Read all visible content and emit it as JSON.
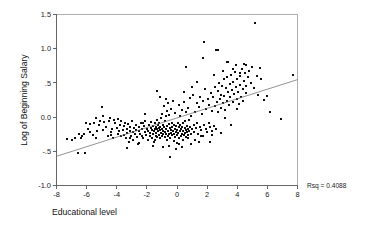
{
  "chart_data": {
    "type": "scatter",
    "title": "",
    "xlabel": "Educational level",
    "ylabel": "Log of Beginning Salary",
    "xlim": [
      -8,
      8
    ],
    "ylim": [
      -1.0,
      1.5
    ],
    "grid": false,
    "legend": null,
    "xticks": [
      -8,
      -6,
      -4,
      -2,
      0,
      2,
      4,
      6,
      8
    ],
    "xticklabels": [
      "-8",
      "-6",
      "-4",
      "-2",
      "0",
      "2",
      "4",
      "6",
      "8"
    ],
    "yticks": [
      -1.0,
      -0.5,
      0.0,
      0.5,
      1.0,
      1.5
    ],
    "yticklabels": [
      "-1.0",
      "-.5",
      "0.0",
      ".5",
      "1.0",
      "1.5"
    ],
    "annotations": [
      {
        "name": "rsq",
        "text": "Rsq = 0.4088",
        "x": 8.5,
        "y": -1.05
      }
    ],
    "fit_line": {
      "name": "linear-regression-line",
      "x": [
        -8,
        8
      ],
      "y": [
        -0.573,
        0.548
      ],
      "slope": 0.0701,
      "intercept": -0.0125,
      "rsq": 0.4088
    },
    "marker": {
      "shape": "square",
      "size": 2.0,
      "color": "#0d0d0d"
    },
    "points": [
      [
        -7.3,
        -0.32
      ],
      [
        -7.0,
        -0.33
      ],
      [
        -6.8,
        -0.3
      ],
      [
        -6.6,
        -0.52
      ],
      [
        -6.4,
        -0.31
      ],
      [
        -6.3,
        -0.28
      ],
      [
        -6.2,
        -0.25
      ],
      [
        -6.1,
        -0.53
      ],
      [
        -6.05,
        -0.09
      ],
      [
        -5.9,
        -0.17
      ],
      [
        -5.8,
        -0.1
      ],
      [
        -5.6,
        -0.26
      ],
      [
        -5.5,
        -0.08
      ],
      [
        -5.4,
        -0.3
      ],
      [
        -5.3,
        -0.21
      ],
      [
        -5.2,
        -0.11
      ],
      [
        -5.1,
        -0.06
      ],
      [
        -5.0,
        0.15
      ],
      [
        -4.9,
        -0.19
      ],
      [
        -4.85,
        -0.07
      ],
      [
        -4.7,
        -0.14
      ],
      [
        -4.6,
        -0.27
      ],
      [
        -4.5,
        -0.05
      ],
      [
        -4.45,
        -0.02
      ],
      [
        -4.4,
        -0.22
      ],
      [
        -4.3,
        -0.18
      ],
      [
        -4.25,
        -0.3
      ],
      [
        -4.2,
        -0.04
      ],
      [
        -4.1,
        -0.08
      ],
      [
        -4.0,
        -0.16
      ],
      [
        -3.95,
        -0.24
      ],
      [
        -3.9,
        -0.03
      ],
      [
        -3.85,
        -0.21
      ],
      [
        -3.8,
        -0.12
      ],
      [
        -3.75,
        -0.27
      ],
      [
        -3.7,
        -0.05
      ],
      [
        -3.6,
        -0.19
      ],
      [
        -3.55,
        -0.26
      ],
      [
        -3.5,
        -0.13
      ],
      [
        -3.45,
        -0.08
      ],
      [
        -3.4,
        -0.3
      ],
      [
        -3.35,
        -0.17
      ],
      [
        -3.3,
        -0.23
      ],
      [
        -3.25,
        -0.1
      ],
      [
        -3.2,
        -0.36
      ],
      [
        -3.15,
        -0.2
      ],
      [
        -3.1,
        -0.14
      ],
      [
        -3.05,
        -0.28
      ],
      [
        -3.0,
        -0.06
      ],
      [
        -2.95,
        -0.22
      ],
      [
        -2.9,
        -0.33
      ],
      [
        -2.85,
        -0.16
      ],
      [
        -2.8,
        -0.25
      ],
      [
        -2.75,
        -0.11
      ],
      [
        -2.7,
        -0.19
      ],
      [
        -2.65,
        -0.29
      ],
      [
        -2.6,
        -0.4
      ],
      [
        -2.55,
        -0.21
      ],
      [
        -2.5,
        -0.15
      ],
      [
        -2.45,
        -0.24
      ],
      [
        -2.4,
        -0.09
      ],
      [
        -2.35,
        -0.27
      ],
      [
        -2.3,
        -0.18
      ],
      [
        -2.25,
        -0.31
      ],
      [
        -2.2,
        -0.13
      ],
      [
        -2.15,
        -0.22
      ],
      [
        -2.1,
        -0.05
      ],
      [
        -2.05,
        -0.26
      ],
      [
        -2.0,
        -0.17
      ],
      [
        -1.95,
        -0.34
      ],
      [
        -1.9,
        -0.2
      ],
      [
        -1.85,
        -0.11
      ],
      [
        -1.8,
        -0.28
      ],
      [
        -1.78,
        -0.23
      ],
      [
        -1.75,
        -0.16
      ],
      [
        -1.7,
        -0.07
      ],
      [
        -1.68,
        -0.3
      ],
      [
        -1.65,
        -0.19
      ],
      [
        -1.6,
        -0.25
      ],
      [
        -1.58,
        -0.13
      ],
      [
        -1.55,
        -0.36
      ],
      [
        -1.5,
        -0.21
      ],
      [
        -1.48,
        -0.17
      ],
      [
        -1.45,
        -0.09
      ],
      [
        -1.42,
        -0.27
      ],
      [
        -1.4,
        -0.14
      ],
      [
        -1.38,
        -0.23
      ],
      [
        -1.35,
        -0.04
      ],
      [
        -1.32,
        -0.18
      ],
      [
        -1.3,
        -0.29
      ],
      [
        -1.28,
        -0.12
      ],
      [
        -1.25,
        -0.21
      ],
      [
        -1.22,
        -0.16
      ],
      [
        -1.2,
        -0.26
      ],
      [
        -1.18,
        -0.08
      ],
      [
        -1.15,
        -0.19
      ],
      [
        -1.12,
        -0.31
      ],
      [
        -1.1,
        -0.14
      ],
      [
        -1.08,
        -0.23
      ],
      [
        -1.05,
        -0.02
      ],
      [
        -1.02,
        -0.17
      ],
      [
        -1.0,
        -0.27
      ],
      [
        -0.98,
        0.05
      ],
      [
        -0.95,
        -0.2
      ],
      [
        -0.92,
        -0.11
      ],
      [
        -0.9,
        -0.24
      ],
      [
        -0.88,
        0.16
      ],
      [
        -0.85,
        -0.15
      ],
      [
        -0.82,
        -0.29
      ],
      [
        -0.8,
        -0.06
      ],
      [
        -0.78,
        -0.22
      ],
      [
        -0.75,
        0.01
      ],
      [
        -0.72,
        -0.18
      ],
      [
        -0.7,
        -0.25
      ],
      [
        -0.68,
        0.09
      ],
      [
        -0.65,
        -0.13
      ],
      [
        -0.62,
        -0.28
      ],
      [
        -0.6,
        0.2
      ],
      [
        -0.58,
        -0.21
      ],
      [
        -0.55,
        -0.1
      ],
      [
        -0.52,
        -0.24
      ],
      [
        -0.5,
        0.03
      ],
      [
        -0.48,
        -0.16
      ],
      [
        -0.45,
        -0.3
      ],
      [
        -0.42,
        -0.19
      ],
      [
        -0.4,
        0.12
      ],
      [
        -0.38,
        -0.23
      ],
      [
        -0.35,
        -0.08
      ],
      [
        -0.32,
        -0.26
      ],
      [
        -0.3,
        -0.14
      ],
      [
        -0.28,
        0.24
      ],
      [
        -0.25,
        -0.2
      ],
      [
        -0.22,
        -0.35
      ],
      [
        -0.2,
        -0.11
      ],
      [
        -0.18,
        -0.25
      ],
      [
        -0.15,
        0.06
      ],
      [
        -0.12,
        -0.17
      ],
      [
        -0.1,
        -0.29
      ],
      [
        -0.08,
        -0.22
      ],
      [
        -0.05,
        -0.13
      ],
      [
        -0.02,
        -0.38
      ],
      [
        0.0,
        -0.19
      ],
      [
        0.02,
        -0.26
      ],
      [
        0.05,
        -0.09
      ],
      [
        0.08,
        -0.23
      ],
      [
        0.1,
        0.18
      ],
      [
        0.12,
        -0.15
      ],
      [
        0.15,
        -0.31
      ],
      [
        0.18,
        -0.21
      ],
      [
        0.2,
        -0.12
      ],
      [
        0.22,
        0.02
      ],
      [
        0.25,
        -0.27
      ],
      [
        0.28,
        -0.17
      ],
      [
        0.3,
        -0.24
      ],
      [
        0.32,
        0.1
      ],
      [
        0.35,
        -0.14
      ],
      [
        0.38,
        -0.33
      ],
      [
        0.4,
        -0.2
      ],
      [
        0.42,
        -0.08
      ],
      [
        0.45,
        -0.26
      ],
      [
        0.48,
        0.22
      ],
      [
        0.5,
        -0.16
      ],
      [
        0.52,
        -0.23
      ],
      [
        0.55,
        -0.05
      ],
      [
        0.58,
        -0.19
      ],
      [
        0.6,
        -0.29
      ],
      [
        0.62,
        0.07
      ],
      [
        0.65,
        -0.13
      ],
      [
        0.68,
        -0.22
      ],
      [
        0.7,
        0.14
      ],
      [
        0.72,
        -0.17
      ],
      [
        0.75,
        -0.26
      ],
      [
        0.78,
        -0.04
      ],
      [
        0.8,
        -0.2
      ],
      [
        0.85,
        0.28
      ],
      [
        0.88,
        -0.15
      ],
      [
        0.9,
        -0.24
      ],
      [
        0.95,
        0.01
      ],
      [
        1.0,
        -0.18
      ],
      [
        1.05,
        0.33
      ],
      [
        1.1,
        -0.12
      ],
      [
        1.15,
        -0.22
      ],
      [
        1.2,
        0.08
      ],
      [
        1.25,
        -0.16
      ],
      [
        1.3,
        0.21
      ],
      [
        1.35,
        -0.09
      ],
      [
        1.4,
        -0.25
      ],
      [
        1.45,
        0.15
      ],
      [
        1.5,
        -0.14
      ],
      [
        1.55,
        0.3
      ],
      [
        1.6,
        -0.19
      ],
      [
        1.65,
        0.05
      ],
      [
        1.7,
        -0.27
      ],
      [
        1.75,
        0.24
      ],
      [
        1.8,
        -0.11
      ],
      [
        1.85,
        0.41
      ],
      [
        1.9,
        -0.17
      ],
      [
        1.95,
        0.12
      ],
      [
        2.0,
        -0.22
      ],
      [
        2.05,
        0.26
      ],
      [
        2.1,
        -0.08
      ],
      [
        2.15,
        0.18
      ],
      [
        2.2,
        -0.15
      ],
      [
        2.25,
        0.35
      ],
      [
        2.3,
        -0.2
      ],
      [
        2.35,
        0.09
      ],
      [
        2.4,
        0.29
      ],
      [
        2.45,
        -0.13
      ],
      [
        2.5,
        0.44
      ],
      [
        2.55,
        0.16
      ],
      [
        2.6,
        -0.18
      ],
      [
        2.65,
        0.22
      ],
      [
        2.7,
        0.38
      ],
      [
        2.75,
        0.07
      ],
      [
        2.8,
        0.5
      ],
      [
        2.85,
        0.27
      ],
      [
        2.9,
        0.14
      ],
      [
        2.95,
        0.33
      ],
      [
        3.0,
        0.46
      ],
      [
        3.05,
        0.2
      ],
      [
        3.1,
        0.55
      ],
      [
        3.15,
        0.31
      ],
      [
        3.2,
        0.11
      ],
      [
        3.25,
        0.42
      ],
      [
        3.3,
        0.24
      ],
      [
        3.35,
        0.58
      ],
      [
        3.4,
        0.36
      ],
      [
        3.45,
        0.17
      ],
      [
        3.5,
        0.48
      ],
      [
        3.55,
        0.29
      ],
      [
        3.6,
        0.62
      ],
      [
        3.65,
        0.4
      ],
      [
        3.7,
        0.22
      ],
      [
        3.75,
        0.52
      ],
      [
        3.8,
        0.34
      ],
      [
        3.85,
        0.66
      ],
      [
        3.9,
        0.44
      ],
      [
        3.95,
        0.26
      ],
      [
        4.0,
        0.56
      ],
      [
        4.05,
        0.37
      ],
      [
        4.1,
        0.19
      ],
      [
        4.15,
        0.6
      ],
      [
        4.2,
        0.47
      ],
      [
        4.25,
        0.3
      ],
      [
        4.3,
        0.7
      ],
      [
        4.35,
        0.41
      ],
      [
        4.4,
        0.23
      ],
      [
        4.45,
        0.53
      ],
      [
        4.5,
        0.64
      ],
      [
        4.55,
        0.35
      ],
      [
        4.6,
        0.45
      ],
      [
        4.7,
        0.58
      ],
      [
        4.8,
        0.67
      ],
      [
        4.9,
        0.5
      ],
      [
        5.0,
        0.73
      ],
      [
        5.1,
        0.42
      ],
      [
        5.2,
        1.37
      ],
      [
        5.3,
        0.6
      ],
      [
        5.4,
        0.33
      ],
      [
        5.5,
        0.72
      ],
      [
        5.6,
        0.55
      ],
      [
        5.8,
        0.25
      ],
      [
        6.0,
        0.31
      ],
      [
        6.2,
        0.08
      ],
      [
        6.9,
        -0.03
      ],
      [
        7.7,
        0.61
      ],
      [
        1.8,
        1.1
      ],
      [
        2.6,
        0.98
      ],
      [
        2.75,
        0.98
      ],
      [
        1.75,
        0.87
      ],
      [
        3.35,
        0.8
      ],
      [
        3.4,
        0.8
      ],
      [
        0.6,
        0.73
      ],
      [
        3.9,
        0.76
      ],
      [
        4.45,
        0.77
      ],
      [
        4.6,
        0.76
      ],
      [
        -0.45,
        -0.58
      ],
      [
        -0.5,
        -0.42
      ],
      [
        -3.3,
        -0.45
      ],
      [
        -1.35,
        0.38
      ],
      [
        -2.55,
        -0.38
      ],
      [
        0.35,
        -0.44
      ],
      [
        0.9,
        -0.4
      ],
      [
        1.45,
        -0.37
      ],
      [
        2.2,
        -0.36
      ],
      [
        2.9,
        -0.23
      ],
      [
        3.6,
        -0.12
      ],
      [
        -0.05,
        -0.46
      ],
      [
        0.15,
        -0.4
      ],
      [
        -0.9,
        -0.44
      ],
      [
        -1.6,
        -0.42
      ],
      [
        1.2,
        -0.33
      ],
      [
        -5.4,
        -0.01
      ],
      [
        -4.9,
        0.02
      ],
      [
        -2.1,
        0.04
      ],
      [
        -1.15,
        0.3
      ],
      [
        -0.75,
        0.27
      ],
      [
        0.45,
        0.36
      ],
      [
        1.0,
        0.44
      ],
      [
        1.35,
        0.52
      ],
      [
        2.45,
        0.62
      ],
      [
        3.05,
        0.68
      ],
      [
        3.75,
        0.71
      ],
      [
        4.15,
        0.64
      ],
      [
        -6.5,
        -0.24
      ],
      [
        -5.75,
        -0.22
      ],
      [
        -4.35,
        -0.26
      ],
      [
        -3.15,
        -0.31
      ],
      [
        -2.25,
        -0.08
      ],
      [
        -1.45,
        -0.34
      ],
      [
        -0.65,
        -0.33
      ],
      [
        0.7,
        -0.3
      ],
      [
        1.6,
        -0.28
      ],
      [
        2.35,
        -0.26
      ],
      [
        3.2,
        -0.02
      ],
      [
        4.0,
        0.12
      ]
    ]
  }
}
